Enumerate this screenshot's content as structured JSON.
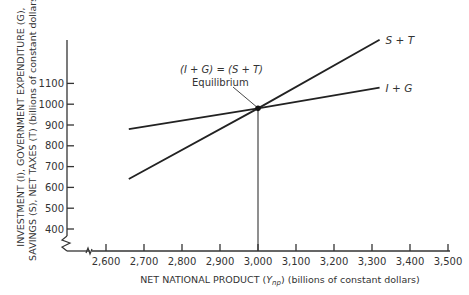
{
  "chart_data": {
    "type": "line",
    "title": "",
    "xlabel": "NET NATIONAL PRODUCT (Ynp) (billions of constant dollars)",
    "xlabel_parts": {
      "before": "NET NATIONAL PRODUCT (",
      "var": "Y",
      "sub": "np",
      "after": ") (billions of constant dollars)"
    },
    "ylabel_line1": "INVESTMENT (I), GOVERNMENT EXPENDITURE (G),",
    "ylabel_line2": "SAVINGS (S), NET TAXES (T) (billions of constant dollars)",
    "x_ticks": [
      2600,
      2700,
      2800,
      2900,
      3000,
      3100,
      3200,
      3300,
      3400,
      3500
    ],
    "x_tick_labels": [
      "2,600",
      "2,700",
      "2,800",
      "2,900",
      "3,000",
      "3,100",
      "3,200",
      "3,300",
      "3,400",
      "3,500"
    ],
    "y_ticks": [
      400,
      500,
      600,
      700,
      800,
      900,
      1000,
      1100
    ],
    "y_tick_labels": [
      "400",
      "500",
      "600",
      "700",
      "800",
      "900",
      "1000",
      "1100"
    ],
    "xlim": [
      2600,
      3500
    ],
    "ylim": [
      400,
      1100
    ],
    "axis_breaks": {
      "x": true,
      "y": true
    },
    "grid": false,
    "series": [
      {
        "name": "S + T",
        "x": [
          2660,
          3000,
          3320
        ],
        "y": [
          640,
          980,
          1310
        ]
      },
      {
        "name": "I + G",
        "x": [
          2660,
          3000,
          3320
        ],
        "y": [
          880,
          980,
          1080
        ]
      }
    ],
    "annotations": [
      {
        "text": "(I + G) = (S + T)",
        "x": 3000,
        "y": 980
      },
      {
        "text": "Equilibrium",
        "x": 3000,
        "y": 980
      }
    ],
    "equilibrium": {
      "x": 3000,
      "y": 980
    }
  }
}
